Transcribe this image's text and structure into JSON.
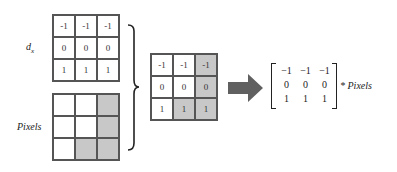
{
  "diagram": {
    "kernel": {
      "label": "d",
      "label_subscript": "x",
      "values": [
        [
          "-1",
          "-1",
          "-1"
        ],
        [
          "0",
          "0",
          "0"
        ],
        [
          "1",
          "1",
          "1"
        ]
      ]
    },
    "pixels": {
      "label": "Pixels",
      "shaded": [
        [
          false,
          false,
          true
        ],
        [
          false,
          false,
          true
        ],
        [
          false,
          true,
          true
        ]
      ]
    },
    "result": {
      "values": [
        [
          "-1",
          "-1",
          "-1"
        ],
        [
          "0",
          "0",
          "0"
        ],
        [
          "1",
          "1",
          "1"
        ]
      ],
      "shaded": [
        [
          false,
          false,
          true
        ],
        [
          false,
          false,
          true
        ],
        [
          false,
          true,
          true
        ]
      ]
    },
    "equation": {
      "matrix": [
        [
          "−1",
          "−1",
          "−1"
        ],
        [
          "0",
          "0",
          "0"
        ],
        [
          "1",
          "1",
          "1"
        ]
      ],
      "operator": "*",
      "operand": "Pixels"
    },
    "colors": {
      "grid_border": "#555555",
      "shaded_cell": "#c8c8c8",
      "arrow": "#606060"
    }
  }
}
